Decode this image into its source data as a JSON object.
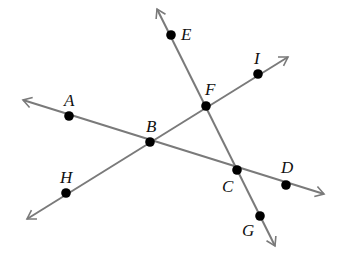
{
  "diagram": {
    "type": "intersecting-lines",
    "line_color": "#7a7a7a",
    "point_color": "#000000",
    "lines": [
      {
        "name": "line-AD",
        "from": [
          23,
          100
        ],
        "to": [
          324,
          194
        ],
        "through": [
          "A",
          "B",
          "C",
          "D"
        ]
      },
      {
        "name": "line-HI",
        "from": [
          27,
          219
        ],
        "to": [
          288,
          57
        ],
        "through": [
          "H",
          "B",
          "F",
          "I"
        ]
      },
      {
        "name": "line-EG",
        "from": [
          157,
          9
        ],
        "to": [
          275,
          246
        ],
        "through": [
          "E",
          "F",
          "C",
          "G"
        ]
      }
    ],
    "points": [
      {
        "label": "A",
        "x": 69,
        "y": 116,
        "lx": 64,
        "ly": 106
      },
      {
        "label": "B",
        "x": 150,
        "y": 142,
        "lx": 146,
        "ly": 132
      },
      {
        "label": "C",
        "x": 237,
        "y": 170,
        "lx": 222,
        "ly": 192
      },
      {
        "label": "D",
        "x": 286,
        "y": 185,
        "lx": 281,
        "ly": 173
      },
      {
        "label": "E",
        "x": 171,
        "y": 35,
        "lx": 181,
        "ly": 40
      },
      {
        "label": "F",
        "x": 206,
        "y": 106,
        "lx": 205,
        "ly": 95
      },
      {
        "label": "G",
        "x": 260,
        "y": 216,
        "lx": 242,
        "ly": 236
      },
      {
        "label": "H",
        "x": 66,
        "y": 193,
        "lx": 60,
        "ly": 183
      },
      {
        "label": "I",
        "x": 258,
        "y": 74,
        "lx": 254,
        "ly": 64
      }
    ]
  }
}
